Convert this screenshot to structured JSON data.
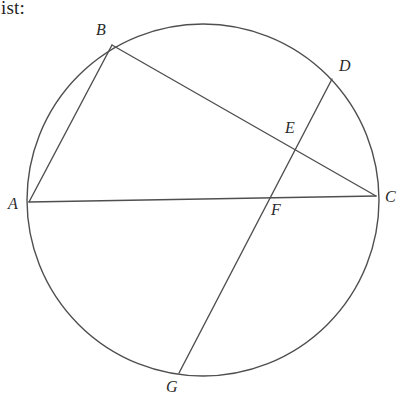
{
  "page": {
    "width": 407,
    "height": 403,
    "background_color": "#ffffff",
    "caption": "ist:"
  },
  "figure": {
    "stroke_color": "#4f4f4f",
    "stroke_width": 1.4,
    "label_color": "#2b2b2b",
    "circle": {
      "center_x": 203,
      "center_y": 200,
      "radius": 176
    },
    "points": [
      {
        "id": "A",
        "label": "A",
        "x": 29,
        "y": 202,
        "label_x": 8,
        "label_y": 196,
        "on_circle": true
      },
      {
        "id": "B",
        "label": "B",
        "x": 112,
        "y": 45,
        "label_x": 96,
        "label_y": 22,
        "on_circle": true
      },
      {
        "id": "C",
        "label": "C",
        "x": 376,
        "y": 196,
        "label_x": 385,
        "label_y": 189,
        "on_circle": true
      },
      {
        "id": "D",
        "label": "D",
        "x": 332,
        "y": 79,
        "label_x": 339,
        "label_y": 58,
        "on_circle": true
      },
      {
        "id": "E",
        "label": "E",
        "x": 296,
        "y": 152,
        "label_x": 285,
        "label_y": 120,
        "on_circle": false
      },
      {
        "id": "F",
        "label": "F",
        "x": 268,
        "y": 197,
        "label_x": 271,
        "label_y": 202,
        "on_circle": false
      },
      {
        "id": "G",
        "label": "G",
        "x": 179,
        "y": 373,
        "label_x": 166,
        "label_y": 379,
        "on_circle": true
      }
    ],
    "segments": [
      {
        "id": "AB",
        "from": "A",
        "to": "B",
        "x1": 29,
        "y1": 202,
        "x2": 112,
        "y2": 45
      },
      {
        "id": "AC",
        "from": "A",
        "to": "C",
        "x1": 29,
        "y1": 202,
        "x2": 376,
        "y2": 196
      },
      {
        "id": "BC",
        "from": "B",
        "to": "C",
        "x1": 112,
        "y1": 45,
        "x2": 376,
        "y2": 196
      },
      {
        "id": "DG",
        "from": "D",
        "to": "G",
        "x1": 332,
        "y1": 79,
        "x2": 179,
        "y2": 373
      }
    ]
  }
}
